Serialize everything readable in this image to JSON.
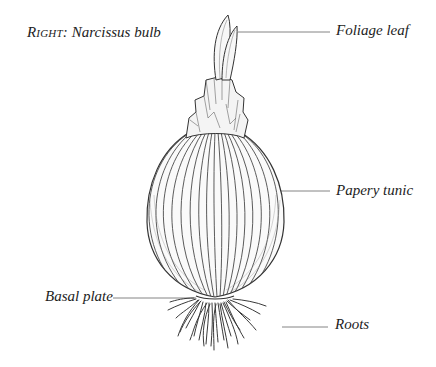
{
  "caption": {
    "prefix": "Right:",
    "title": "Narcissus bulb"
  },
  "labels": {
    "foliage_leaf": "Foliage leaf",
    "papery_tunic": "Papery tunic",
    "basal_plate": "Basal plate",
    "roots": "Roots"
  },
  "colors": {
    "ink": "#2a2a2a",
    "leader": "#555555",
    "background": "#ffffff"
  }
}
